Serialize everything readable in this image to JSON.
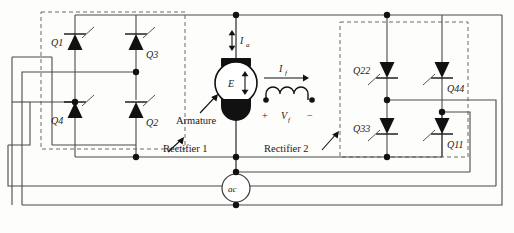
{
  "figure": {
    "type": "circuit-schematic"
  },
  "rectifier1": {
    "label": "Rectifier 1",
    "thyristors": [
      {
        "id": "Q1",
        "label": "Q1",
        "position": "top-left",
        "direction": "up"
      },
      {
        "id": "Q3",
        "label": "Q3",
        "position": "top-right",
        "direction": "up"
      },
      {
        "id": "Q4",
        "label": "Q4",
        "position": "bottom-left",
        "direction": "up"
      },
      {
        "id": "Q2",
        "label": "Q2",
        "position": "bottom-right",
        "direction": "up"
      }
    ]
  },
  "rectifier2": {
    "label": "Rectifier 2",
    "thyristors": [
      {
        "id": "Q22",
        "label": "Q22",
        "position": "top-left",
        "direction": "down"
      },
      {
        "id": "Q44",
        "label": "Q44",
        "position": "top-right",
        "direction": "down"
      },
      {
        "id": "Q33",
        "label": "Q33",
        "position": "bottom-left",
        "direction": "down"
      },
      {
        "id": "Q11",
        "label": "Q11",
        "position": "bottom-right",
        "direction": "down"
      }
    ]
  },
  "machine": {
    "armature_label": "Armature",
    "emf_label": "E",
    "current_label": "I",
    "current_sub": "a"
  },
  "field": {
    "current_label": "I",
    "current_sub": "f",
    "voltage_label": "V",
    "voltage_sub": "f",
    "plus": "+",
    "minus": "−"
  },
  "source": {
    "label": "ac"
  },
  "colors": {
    "wire": "#4a4a4a",
    "device": "#111111",
    "dashed_box": "#6a6a6a",
    "background": "#fdfdfb"
  }
}
